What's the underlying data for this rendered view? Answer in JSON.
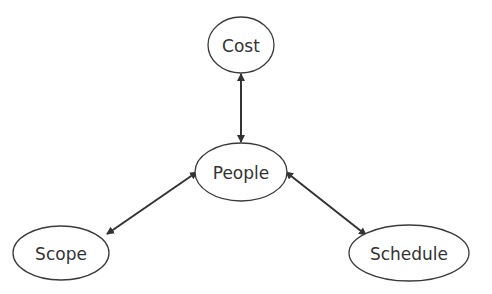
{
  "diagram": {
    "nodes": [
      {
        "id": "cost",
        "label": "Cost",
        "cx": 241,
        "cy": 45,
        "rx": 33,
        "ry": 28
      },
      {
        "id": "people",
        "label": "People",
        "cx": 241,
        "cy": 172,
        "rx": 46,
        "ry": 29
      },
      {
        "id": "scope",
        "label": "Scope",
        "cx": 61,
        "cy": 253,
        "rx": 48,
        "ry": 27
      },
      {
        "id": "schedule",
        "label": "Schedule",
        "cx": 409,
        "cy": 253,
        "rx": 60,
        "ry": 28
      }
    ],
    "edges": [
      {
        "from": "cost",
        "to": "people",
        "type": "bidirectional"
      },
      {
        "from": "people",
        "to": "scope",
        "type": "bidirectional"
      },
      {
        "from": "people",
        "to": "schedule",
        "type": "bidirectional"
      }
    ],
    "colors": {
      "stroke": "#3a3a3a",
      "text": "#333333",
      "background": "#ffffff"
    }
  }
}
